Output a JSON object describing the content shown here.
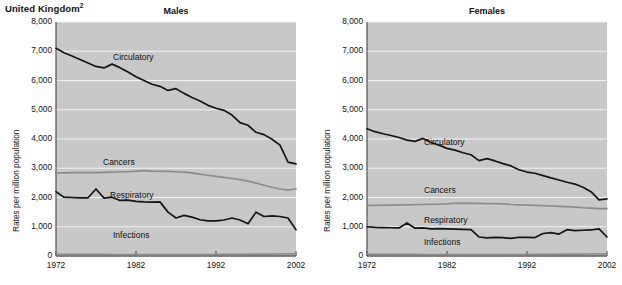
{
  "header": {
    "country_note": "United Kingdom",
    "country_note_superscript": "2"
  },
  "panels": [
    {
      "key": "males",
      "title": "Males"
    },
    {
      "key": "females",
      "title": "Females"
    }
  ],
  "axes": {
    "ylabel": "Rates per million population",
    "yticks": [
      "0",
      "1,000",
      "2,000",
      "3,000",
      "4,000",
      "5,000",
      "6,000",
      "7,000",
      "8,000"
    ],
    "xticks": [
      "1972",
      "1982",
      "1992",
      "2002"
    ],
    "ylim": [
      0,
      8000
    ],
    "xlim": [
      1972,
      2002
    ]
  },
  "series_labels": {
    "circulatory": "Circulatory",
    "cancers": "Cancers",
    "respiratory": "Respiratory",
    "infections": "Infections"
  },
  "colors": {
    "plot_background": "#c8c8c8",
    "gridline": "#f2f2f2",
    "dark_series": "#151515",
    "gray_series": "#8c8c8c",
    "axis": "#5b5b5b",
    "text": "#141414",
    "page_background": "#ffffff"
  },
  "chart_data": [
    {
      "type": "line",
      "title": "Males",
      "xlabel": "",
      "ylabel": "Rates per million population",
      "xlim": [
        1972,
        2002
      ],
      "ylim": [
        0,
        8000
      ],
      "grid": true,
      "legend": "inline-annotations",
      "x": [
        1972,
        1973,
        1974,
        1975,
        1976,
        1977,
        1978,
        1979,
        1980,
        1981,
        1982,
        1983,
        1984,
        1985,
        1986,
        1987,
        1988,
        1989,
        1990,
        1991,
        1992,
        1993,
        1994,
        1995,
        1996,
        1997,
        1998,
        1999,
        2000,
        2001,
        2002
      ],
      "series": [
        {
          "name": "Circulatory",
          "values": [
            7100,
            6950,
            6840,
            6720,
            6600,
            6480,
            6430,
            6560,
            6440,
            6290,
            6130,
            6000,
            5870,
            5800,
            5660,
            5720,
            5560,
            5420,
            5300,
            5150,
            5050,
            4980,
            4820,
            4560,
            4470,
            4230,
            4150,
            3990,
            3790,
            3210,
            3150
          ]
        },
        {
          "name": "Cancers",
          "values": [
            2840,
            2840,
            2850,
            2850,
            2850,
            2850,
            2860,
            2870,
            2880,
            2880,
            2900,
            2920,
            2900,
            2890,
            2890,
            2880,
            2870,
            2840,
            2800,
            2760,
            2720,
            2690,
            2650,
            2610,
            2560,
            2490,
            2420,
            2350,
            2290,
            2250,
            2300
          ]
        },
        {
          "name": "Respiratory",
          "values": [
            2200,
            2010,
            2000,
            1990,
            1990,
            2290,
            1980,
            2010,
            1900,
            1910,
            1870,
            1850,
            1840,
            1850,
            1500,
            1300,
            1390,
            1330,
            1240,
            1200,
            1200,
            1230,
            1300,
            1230,
            1100,
            1500,
            1350,
            1370,
            1350,
            1300,
            900
          ]
        },
        {
          "name": "Infections",
          "values": [
            60,
            58,
            57,
            56,
            55,
            54,
            53,
            52,
            52,
            51,
            50,
            50,
            50,
            50,
            50,
            50,
            50,
            50,
            50,
            50,
            52,
            54,
            56,
            58,
            60,
            62,
            64,
            66,
            68,
            70,
            72
          ]
        }
      ]
    },
    {
      "type": "line",
      "title": "Females",
      "xlabel": "",
      "ylabel": "Rates per million population",
      "xlim": [
        1972,
        2002
      ],
      "ylim": [
        0,
        8000
      ],
      "grid": true,
      "legend": "inline-annotations",
      "x": [
        1972,
        1973,
        1974,
        1975,
        1976,
        1977,
        1978,
        1979,
        1980,
        1981,
        1982,
        1983,
        1984,
        1985,
        1986,
        1987,
        1988,
        1989,
        1990,
        1991,
        1992,
        1993,
        1994,
        1995,
        1996,
        1997,
        1998,
        1999,
        2000,
        2001,
        2002
      ],
      "series": [
        {
          "name": "Circulatory",
          "values": [
            4350,
            4250,
            4180,
            4120,
            4050,
            3960,
            3920,
            4020,
            3880,
            3790,
            3680,
            3620,
            3530,
            3460,
            3260,
            3330,
            3250,
            3160,
            3080,
            2950,
            2870,
            2830,
            2750,
            2670,
            2600,
            2520,
            2460,
            2350,
            2200,
            1920,
            1950
          ]
        },
        {
          "name": "Cancers",
          "values": [
            1730,
            1730,
            1735,
            1740,
            1745,
            1750,
            1755,
            1760,
            1765,
            1770,
            1780,
            1800,
            1810,
            1800,
            1800,
            1790,
            1790,
            1780,
            1760,
            1750,
            1740,
            1730,
            1720,
            1710,
            1700,
            1690,
            1670,
            1650,
            1640,
            1620,
            1620
          ]
        },
        {
          "name": "Respiratory",
          "values": [
            1000,
            980,
            970,
            965,
            960,
            1130,
            950,
            960,
            930,
            935,
            930,
            920,
            910,
            900,
            650,
            620,
            640,
            630,
            600,
            640,
            640,
            630,
            770,
            800,
            750,
            900,
            870,
            880,
            890,
            930,
            650
          ]
        },
        {
          "name": "Infections",
          "values": [
            60,
            58,
            57,
            56,
            55,
            54,
            53,
            52,
            52,
            51,
            50,
            50,
            50,
            50,
            50,
            50,
            50,
            50,
            50,
            50,
            52,
            54,
            56,
            58,
            60,
            62,
            64,
            66,
            68,
            70,
            72
          ]
        }
      ]
    }
  ]
}
